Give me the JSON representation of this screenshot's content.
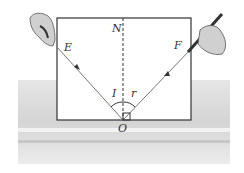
{
  "diagram": {
    "labels": {
      "normal": "N",
      "incident_point": "E",
      "reflected_point": "F",
      "origin": "O",
      "incident_angle": "I",
      "reflection_angle": "r"
    },
    "colors": {
      "board_border": "#333333",
      "ray": "#777777",
      "table": "#d8d8d8",
      "hand": "#cfcfcf"
    }
  }
}
